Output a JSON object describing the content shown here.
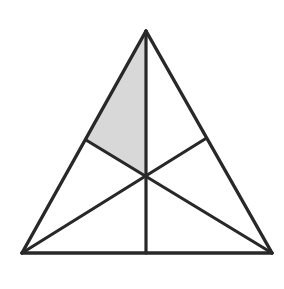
{
  "figure": {
    "type": "geometry-diagram",
    "canvas": {
      "width": 284,
      "height": 289,
      "background": "#ffffff"
    },
    "style": {
      "stroke_color": "#282828",
      "stroke_width": 3.2,
      "shade_color": "#d8d8d8",
      "fill_color": "#ffffff"
    },
    "points": {
      "apex": {
        "label": "A",
        "x": 146,
        "y": 31
      },
      "bottom_left": {
        "label": "B",
        "x": 22,
        "y": 253
      },
      "bottom_right": {
        "label": "C",
        "x": 272,
        "y": 253
      },
      "midpoint_left_side": {
        "label": "M_AB",
        "x": 86,
        "y": 140
      },
      "midpoint_right_side": {
        "label": "M_AC",
        "x": 205,
        "y": 139
      },
      "midpoint_base": {
        "label": "M_BC",
        "x": 146,
        "y": 253
      },
      "centroid": {
        "label": "G",
        "x": 146,
        "y": 176
      }
    },
    "outline_path": "M 146 31 L 272 253 L 22 253 Z",
    "shaded_region": {
      "name": "shaded-quadrilateral",
      "vertices": [
        "apex",
        "midpoint_left_side",
        "centroid"
      ],
      "path": "M 146 31 L 86 140 L 146 176 Z",
      "color": "#d8d8d8"
    },
    "segments": [
      {
        "name": "side-left",
        "from": "apex",
        "to": "bottom_left",
        "path": "M 146 31 L 22 253"
      },
      {
        "name": "side-right",
        "from": "apex",
        "to": "bottom_right",
        "path": "M 146 31 L 272 253"
      },
      {
        "name": "base",
        "from": "bottom_left",
        "to": "bottom_right",
        "path": "M 22 253 L 272 253"
      },
      {
        "name": "median-from-apex",
        "from": "apex",
        "to": "midpoint_base",
        "path": "M 146 31 L 146 253"
      },
      {
        "name": "median-from-bottom-right",
        "from": "bottom_right",
        "to": "midpoint_left_side",
        "path": "M 272 253 L 86 140"
      },
      {
        "name": "median-from-bottom-left",
        "from": "bottom_left",
        "to": "midpoint_right_side",
        "path": "M 22 253 L 205 139"
      }
    ]
  }
}
